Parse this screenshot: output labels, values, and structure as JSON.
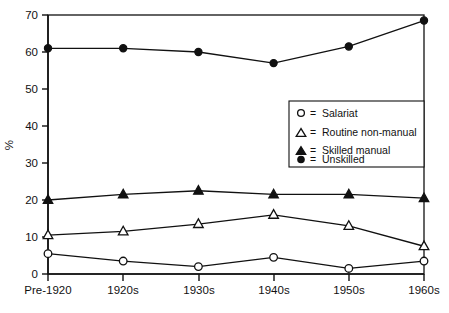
{
  "chart_data": {
    "type": "line",
    "title": "",
    "xlabel": "",
    "ylabel": "%",
    "categories": [
      "Pre-1920",
      "1920s",
      "1930s",
      "1940s",
      "1950s",
      "1960s"
    ],
    "ylim": [
      0,
      70
    ],
    "yticks": [
      0,
      10,
      20,
      30,
      40,
      50,
      60,
      70
    ],
    "grid": false,
    "legend_position": "center-right",
    "series": [
      {
        "name": "Salariat",
        "marker": "open-circle",
        "values": [
          5.5,
          3.5,
          2.0,
          4.5,
          1.5,
          3.5
        ]
      },
      {
        "name": "Routine non-manual",
        "marker": "open-triangle",
        "values": [
          10.5,
          11.5,
          13.5,
          16.0,
          13.0,
          7.5
        ]
      },
      {
        "name": "Skilled manual",
        "marker": "filled-triangle",
        "values": [
          20.0,
          21.5,
          22.5,
          21.5,
          21.5,
          20.5
        ]
      },
      {
        "name": "Unskilled",
        "marker": "filled-circle",
        "values": [
          61.0,
          61.0,
          60.0,
          57.0,
          61.5,
          68.5
        ]
      }
    ]
  },
  "axes": {
    "y_title": "%",
    "y_tick_labels": [
      "0",
      "10",
      "20",
      "30",
      "40",
      "50",
      "60",
      "70"
    ],
    "x_tick_labels": [
      "Pre-1920",
      "1920s",
      "1930s",
      "1940s",
      "1950s",
      "1960s"
    ]
  },
  "legend": {
    "equals_sign": "=",
    "entries": [
      {
        "marker": "open-circle-marker",
        "label": "Salariat"
      },
      {
        "marker": "open-triangle-marker",
        "label": "Routine non-manual"
      },
      {
        "marker": "filled-triangle-marker",
        "label": "Skilled manual"
      },
      {
        "marker": "filled-circle-marker",
        "label": "Unskilled"
      }
    ]
  },
  "colors": {
    "ink": "#111111",
    "background": "#ffffff"
  }
}
